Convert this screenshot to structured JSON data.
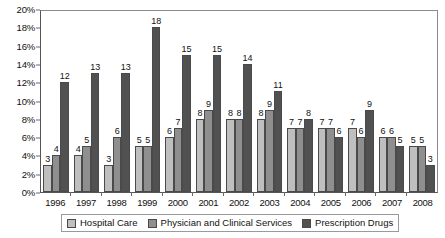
{
  "chart_data": {
    "type": "bar",
    "title": "",
    "subtitle": "",
    "xlabel": "",
    "ylabel": "",
    "ylim": [
      0,
      20
    ],
    "ytick_step": 2,
    "ytick_labels": [
      "0%",
      "2%",
      "4%",
      "6%",
      "8%",
      "10%",
      "12%",
      "14%",
      "16%",
      "18%",
      "20%"
    ],
    "grid": false,
    "legend_position": "bottom",
    "categories": [
      "1996",
      "1997",
      "1998",
      "1999",
      "2000",
      "2001",
      "2002",
      "2003",
      "2004",
      "2005",
      "2006",
      "2007",
      "2008"
    ],
    "series": [
      {
        "name": "Hospital Care",
        "color": "#bfbfbf",
        "values": [
          3,
          4,
          3,
          5,
          6,
          8,
          8,
          8,
          7,
          7,
          7,
          6,
          5
        ]
      },
      {
        "name": "Physician and Clinical Services",
        "color": "#8f8f8f",
        "values": [
          4,
          5,
          6,
          5,
          7,
          9,
          8,
          9,
          7,
          7,
          6,
          6,
          5
        ]
      },
      {
        "name": "Prescription Drugs",
        "color": "#515151",
        "values": [
          12,
          13,
          13,
          18,
          15,
          15,
          14,
          11,
          8,
          6,
          9,
          5,
          3
        ]
      }
    ]
  },
  "legend": {
    "items": [
      {
        "label": "Hospital Care"
      },
      {
        "label": "Physician and Clinical Services"
      },
      {
        "label": "Prescription Drugs"
      }
    ]
  }
}
